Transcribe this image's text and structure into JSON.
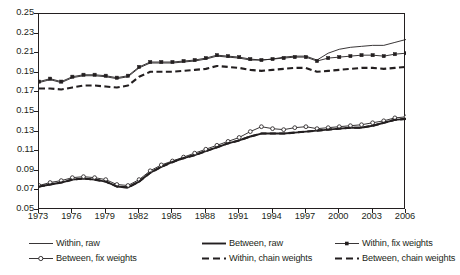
{
  "chart_data": {
    "type": "line",
    "title": "",
    "xlabel": "",
    "ylabel": "",
    "xlim": [
      1973,
      2006
    ],
    "ylim": [
      0.05,
      0.25
    ],
    "ytick_step": 0.02,
    "xtick_step": 3,
    "grid": false,
    "legend_position": "bottom",
    "ytick_labels": [
      "0.25",
      "0.23",
      "0.21",
      "0.19",
      "0.17",
      "0.15",
      "0.13",
      "0.11",
      "0.09",
      "0.07",
      "0.05"
    ],
    "ytick_values": [
      0.25,
      0.23,
      0.21,
      0.19,
      0.17,
      0.15,
      0.13,
      0.11,
      0.09,
      0.07,
      0.05
    ],
    "xtick_labels": [
      "1973",
      "1976",
      "1979",
      "1982",
      "1985",
      "1988",
      "1991",
      "1994",
      "1997",
      "2000",
      "2003",
      "2006"
    ],
    "xtick_values": [
      1973,
      1976,
      1979,
      1982,
      1985,
      1988,
      1991,
      1994,
      1997,
      2000,
      2003,
      2006
    ],
    "x": [
      1973,
      1974,
      1975,
      1976,
      1977,
      1978,
      1979,
      1980,
      1981,
      1982,
      1983,
      1984,
      1985,
      1986,
      1987,
      1988,
      1989,
      1990,
      1991,
      1992,
      1993,
      1994,
      1995,
      1996,
      1997,
      1998,
      1999,
      2000,
      2001,
      2002,
      2003,
      2004,
      2005,
      2006
    ],
    "series": [
      {
        "name": "Within, raw",
        "style": "thin-solid",
        "color": "#231f20",
        "values": [
          0.18,
          0.183,
          0.18,
          0.185,
          0.187,
          0.187,
          0.186,
          0.184,
          0.186,
          0.195,
          0.2,
          0.2,
          0.2,
          0.201,
          0.202,
          0.204,
          0.207,
          0.206,
          0.205,
          0.203,
          0.203,
          0.204,
          0.206,
          0.207,
          0.207,
          0.203,
          0.21,
          0.214,
          0.216,
          0.217,
          0.218,
          0.218,
          0.221,
          0.224
        ]
      },
      {
        "name": "Between, raw",
        "style": "thick-solid",
        "color": "#231f20",
        "values": [
          0.074,
          0.076,
          0.078,
          0.081,
          0.082,
          0.081,
          0.079,
          0.074,
          0.073,
          0.079,
          0.088,
          0.094,
          0.099,
          0.103,
          0.106,
          0.11,
          0.114,
          0.118,
          0.121,
          0.125,
          0.128,
          0.128,
          0.128,
          0.129,
          0.13,
          0.131,
          0.132,
          0.133,
          0.134,
          0.134,
          0.136,
          0.139,
          0.142,
          0.143
        ]
      },
      {
        "name": "Within, fix weights",
        "style": "thin-solid-square",
        "color": "#231f20",
        "values": [
          0.181,
          0.184,
          0.181,
          0.186,
          0.188,
          0.188,
          0.187,
          0.185,
          0.187,
          0.196,
          0.201,
          0.201,
          0.201,
          0.202,
          0.203,
          0.205,
          0.208,
          0.207,
          0.206,
          0.204,
          0.203,
          0.204,
          0.205,
          0.206,
          0.206,
          0.202,
          0.205,
          0.206,
          0.207,
          0.208,
          0.208,
          0.207,
          0.209,
          0.21
        ]
      },
      {
        "name": "Between, fix weights",
        "style": "thin-solid-circle",
        "color": "#231f20",
        "values": [
          0.075,
          0.078,
          0.08,
          0.083,
          0.084,
          0.083,
          0.081,
          0.076,
          0.075,
          0.081,
          0.09,
          0.096,
          0.1,
          0.104,
          0.108,
          0.112,
          0.116,
          0.12,
          0.124,
          0.13,
          0.135,
          0.133,
          0.132,
          0.134,
          0.135,
          0.133,
          0.134,
          0.135,
          0.136,
          0.137,
          0.139,
          0.141,
          0.144,
          0.145
        ]
      },
      {
        "name": "Within, chain weights",
        "style": "thick-dash",
        "color": "#231f20",
        "values": [
          0.174,
          0.174,
          0.173,
          0.175,
          0.177,
          0.177,
          0.176,
          0.175,
          0.177,
          0.186,
          0.191,
          0.191,
          0.191,
          0.192,
          0.193,
          0.194,
          0.197,
          0.196,
          0.195,
          0.193,
          0.192,
          0.193,
          0.194,
          0.195,
          0.195,
          0.191,
          0.192,
          0.193,
          0.194,
          0.195,
          0.195,
          0.194,
          0.195,
          0.196
        ]
      },
      {
        "name": "Between, chain weights",
        "style": "thick-dash",
        "color": "#231f20",
        "values": [
          0.074,
          0.076,
          0.078,
          0.081,
          0.082,
          0.081,
          0.079,
          0.074,
          0.073,
          0.079,
          0.088,
          0.094,
          0.099,
          0.103,
          0.106,
          0.11,
          0.114,
          0.118,
          0.121,
          0.125,
          0.128,
          0.128,
          0.128,
          0.129,
          0.13,
          0.131,
          0.132,
          0.133,
          0.134,
          0.134,
          0.136,
          0.139,
          0.142,
          0.143
        ]
      }
    ]
  },
  "legend": {
    "items": [
      {
        "label": "Within, raw",
        "style": "thin-solid"
      },
      {
        "label": "Between, raw",
        "style": "thick-solid"
      },
      {
        "label": "Within, fix weights",
        "style": "thin-solid-square"
      },
      {
        "label": "Between, fix weights",
        "style": "thin-solid-circle"
      },
      {
        "label": "Within, chain weights",
        "style": "thick-dash"
      },
      {
        "label": "Between, chain weights",
        "style": "thick-dash"
      }
    ]
  }
}
